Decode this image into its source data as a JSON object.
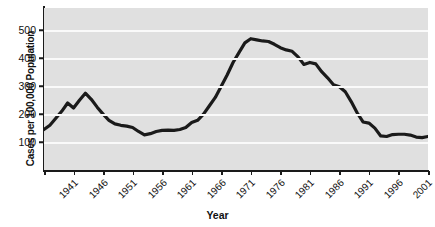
{
  "chart_data": {
    "type": "line",
    "title": "",
    "xlabel": "Year",
    "ylabel": "Cases per 100,000 Population",
    "xlim": [
      1941,
      2006
    ],
    "ylim": [
      0,
      580
    ],
    "grid": true,
    "legend": null,
    "y_ticks": [
      100,
      200,
      300,
      400,
      500
    ],
    "x_ticks": [
      1941,
      1946,
      1951,
      1956,
      1961,
      1966,
      1971,
      1976,
      1981,
      1986,
      1991,
      1996,
      2001,
      2006
    ],
    "line_color": "#1a1a1a",
    "plot_background": "#e0e0e0",
    "gridline_color": "#fafafa",
    "x": [
      1941,
      1942,
      1943,
      1944,
      1945,
      1946,
      1947,
      1948,
      1949,
      1950,
      1951,
      1952,
      1953,
      1954,
      1955,
      1956,
      1957,
      1958,
      1959,
      1960,
      1961,
      1962,
      1963,
      1964,
      1965,
      1966,
      1967,
      1968,
      1969,
      1970,
      1971,
      1972,
      1973,
      1974,
      1975,
      1976,
      1977,
      1978,
      1979,
      1980,
      1981,
      1982,
      1983,
      1984,
      1985,
      1986,
      1987,
      1988,
      1989,
      1990,
      1991,
      1992,
      1993,
      1994,
      1995,
      1996,
      1997,
      1998,
      1999,
      2000,
      2001,
      2002,
      2003,
      2004,
      2005,
      2006
    ],
    "values": [
      145,
      160,
      185,
      210,
      240,
      222,
      250,
      275,
      253,
      225,
      200,
      178,
      165,
      160,
      157,
      152,
      138,
      126,
      130,
      138,
      142,
      143,
      142,
      145,
      152,
      170,
      178,
      200,
      230,
      260,
      300,
      340,
      385,
      420,
      455,
      470,
      466,
      462,
      460,
      450,
      438,
      430,
      425,
      405,
      378,
      385,
      380,
      352,
      330,
      305,
      298,
      280,
      245,
      205,
      172,
      168,
      150,
      122,
      120,
      127,
      128,
      128,
      125,
      118,
      116,
      120
    ]
  },
  "axis_labels": {
    "y_title": "Cases per 100,000 Population",
    "x_title": "Year"
  }
}
